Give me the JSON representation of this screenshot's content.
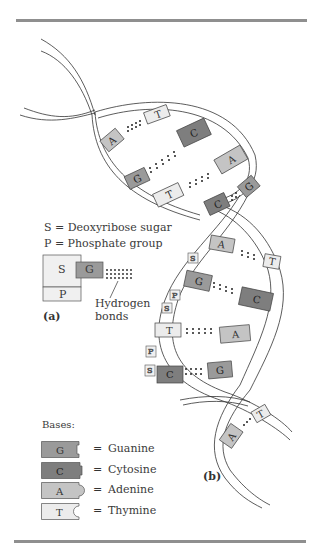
{
  "figure": {
    "panel_a_label": "(a)",
    "panel_b_label": "(b)",
    "legend_sugar": "S = Deoxyribose sugar",
    "legend_phosphate": "P = Phosphate group",
    "nucleotide": {
      "sugar": "S",
      "phosphate": "P",
      "base": "G"
    },
    "hydrogen_bonds_label_line1": "Hydrogen",
    "hydrogen_bonds_label_line2": "bonds",
    "bases_heading": "Bases:",
    "bases_key": [
      {
        "letter": "G",
        "equals": "=",
        "name": "Guanine",
        "color": "#9a9a9a"
      },
      {
        "letter": "C",
        "equals": "=",
        "name": "Cytosine",
        "color": "#7e7e7e"
      },
      {
        "letter": "A",
        "equals": "=",
        "name": "Adenine",
        "color": "#c4c4c4"
      },
      {
        "letter": "T",
        "equals": "=",
        "name": "Thymine",
        "color": "#ececec"
      }
    ],
    "helix_pairs": [
      {
        "left": "A",
        "right": "T"
      },
      {
        "left": "G",
        "right": "C"
      },
      {
        "left": "T",
        "right": "A"
      },
      {
        "left": "C",
        "right": "G"
      },
      {
        "left": "A",
        "right": "T"
      },
      {
        "left": "G",
        "right": "C"
      },
      {
        "left": "T",
        "right": "A"
      },
      {
        "left": "C",
        "right": "G"
      },
      {
        "left": "A",
        "right": "T"
      }
    ],
    "backbone_labels": [
      "S",
      "P",
      "S",
      "P",
      "S"
    ]
  }
}
